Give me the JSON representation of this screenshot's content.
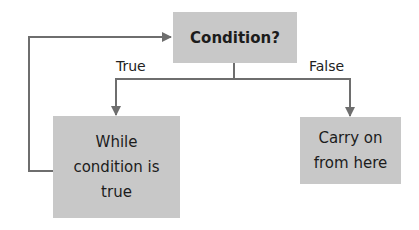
{
  "diagram": {
    "nodes": {
      "condition": "Condition?",
      "while_body": "While condition is true",
      "carry_on": "Carry on from here"
    },
    "edges": {
      "true_label": "True",
      "false_label": "False"
    },
    "colors": {
      "box_fill": "#c8c8c8",
      "line": "#6e6e6e"
    }
  }
}
